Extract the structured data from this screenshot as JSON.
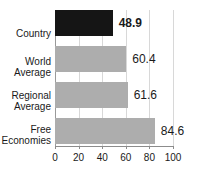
{
  "chart_data": {
    "type": "bar",
    "orientation": "horizontal",
    "title": "",
    "subtitle": "",
    "xlabel": "",
    "ylabel": "",
    "xlim": [
      0,
      100
    ],
    "ylim": null,
    "grid": true,
    "legend": null,
    "legend_position": "none",
    "xticks": [
      "0",
      "20",
      "40",
      "60",
      "80",
      "100"
    ],
    "xtick_values": [
      0,
      20,
      40,
      60,
      80,
      100
    ],
    "categories": [
      "Country",
      "World Average",
      "Regional Average",
      "Free Economies"
    ],
    "values": [
      48.9,
      60.4,
      61.6,
      84.6
    ],
    "value_labels": [
      "48.9",
      "60.4",
      "61.6",
      "84.6"
    ],
    "bars": [
      {
        "label": "Country",
        "label_lines": "Country",
        "value": 48.9,
        "value_label": "48.9",
        "color": "#151515",
        "emphasis": true
      },
      {
        "label": "World Average",
        "label_lines": "World\nAverage",
        "value": 60.4,
        "value_label": "60.4",
        "color": "#adadad",
        "emphasis": false
      },
      {
        "label": "Regional Average",
        "label_lines": "Regional\nAverage",
        "value": 61.6,
        "value_label": "61.6",
        "color": "#adadad",
        "emphasis": false
      },
      {
        "label": "Free Economies",
        "label_lines": "Free\nEconomies",
        "value": 84.6,
        "value_label": "84.6",
        "color": "#adadad",
        "emphasis": false
      }
    ],
    "colors": {
      "country_bar": "#151515",
      "reference_bar": "#adadad",
      "gridline": "#d8d8d8",
      "axis": "#8c8c8c",
      "text": "#1a1a1a",
      "background": "#ffffff"
    }
  }
}
